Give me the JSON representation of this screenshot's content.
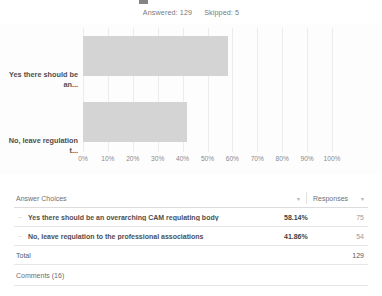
{
  "header": {
    "answered_label": "Answered: 129",
    "skipped_label": "Skipped: 5"
  },
  "chart_data": {
    "type": "bar",
    "orientation": "horizontal",
    "title": "",
    "xlabel": "",
    "ylabel": "",
    "xlim": [
      0,
      100
    ],
    "grid": true,
    "legend": false,
    "categories": [
      "Yes there should be an...",
      "No, leave regulation t..."
    ],
    "values": [
      58.14,
      41.86
    ],
    "counts": [
      75,
      54
    ],
    "xticks": [
      "0%",
      "10%",
      "20%",
      "30%",
      "40%",
      "50%",
      "60%",
      "70%",
      "80%",
      "90%",
      "100%"
    ],
    "bar_color": "#d4d4d4",
    "gridline_color": "#ececec"
  },
  "table": {
    "columns": {
      "choices": "Answer Choices",
      "responses": "Responses"
    },
    "sort_caret": "▾",
    "row_marker": "–",
    "rows": [
      {
        "label": "Yes there should be an overarching CAM regulating body",
        "percent": "58.14%",
        "count": "75"
      },
      {
        "label": "No, leave regulation to the professional associations",
        "percent": "41.86%",
        "count": "54"
      }
    ],
    "total_label": "Total",
    "total_value": "129",
    "comments_label": "Comments (16)"
  }
}
